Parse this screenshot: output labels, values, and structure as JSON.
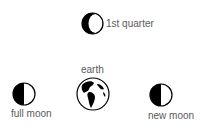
{
  "diagram": {
    "nodes": [
      {
        "id": "first-quarter",
        "label": "1st quarter",
        "icon": "crescent-moon-icon"
      },
      {
        "id": "earth",
        "label": "earth",
        "icon": "globe-icon"
      },
      {
        "id": "full-moon",
        "label": "full moon",
        "icon": "half-moon-icon"
      },
      {
        "id": "new-moon",
        "label": "new moon",
        "icon": "half-moon-icon"
      }
    ]
  },
  "colors": {
    "ink": "#000000",
    "text": "#5a5a5a",
    "background": "#ffffff"
  }
}
